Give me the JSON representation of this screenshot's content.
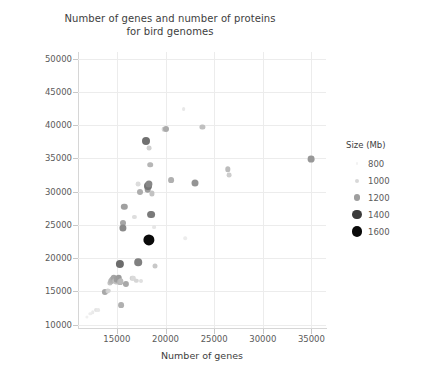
{
  "chart_data": {
    "type": "scatter",
    "title": "Number of genes and number of proteins for bird genomes",
    "title_line1": "Number of genes and number of proteins",
    "title_line2": "for bird genomes",
    "xlabel": "Number of genes",
    "ylabel": "Number of proteins",
    "xlim": [
      11000,
      36500
    ],
    "ylim": [
      9500,
      51000
    ],
    "xticks": [
      15000,
      20000,
      25000,
      30000,
      35000
    ],
    "yticks": [
      10000,
      15000,
      20000,
      25000,
      30000,
      35000,
      40000,
      45000,
      50000
    ],
    "xtick_labels": [
      "15000",
      "20000",
      "25000",
      "30000",
      "35000"
    ],
    "ytick_labels": [
      "10000",
      "15000",
      "20000",
      "25000",
      "30000",
      "35000",
      "40000",
      "45000",
      "50000"
    ],
    "grid": true,
    "size_encoding": "Genome size (Mb) mapped to marker area and darkness",
    "legend": {
      "title": "Size (Mb)",
      "position": "right",
      "entries": [
        {
          "label": "800",
          "value": 800,
          "radius": 1.2,
          "color": "#f2f2f2"
        },
        {
          "label": "1000",
          "value": 1000,
          "radius": 2.0,
          "color": "#d8d8d8"
        },
        {
          "label": "1200",
          "value": 1200,
          "radius": 3.2,
          "color": "#9e9e9e"
        },
        {
          "label": "1400",
          "value": 1400,
          "radius": 4.6,
          "color": "#3a3a3a"
        },
        {
          "label": "1600",
          "value": 1600,
          "radius": 5.4,
          "color": "#0a0a0a"
        }
      ]
    },
    "points": [
      {
        "x": 11900,
        "y": 11200,
        "size": 780,
        "r": 1.6,
        "color": "#f0f0f0"
      },
      {
        "x": 12250,
        "y": 11600,
        "size": 800,
        "r": 1.7,
        "color": "#ededed"
      },
      {
        "x": 12500,
        "y": 11900,
        "size": 820,
        "r": 1.8,
        "color": "#eaeaea"
      },
      {
        "x": 12800,
        "y": 12150,
        "size": 860,
        "r": 2.0,
        "color": "#e4e4e4"
      },
      {
        "x": 13050,
        "y": 12200,
        "size": 850,
        "r": 1.9,
        "color": "#e8e8e8"
      },
      {
        "x": 13800,
        "y": 14900,
        "size": 1180,
        "r": 3.1,
        "color": "#a8a8a8"
      },
      {
        "x": 14050,
        "y": 15000,
        "size": 1050,
        "r": 2.4,
        "color": "#cecece"
      },
      {
        "x": 14150,
        "y": 15100,
        "size": 1020,
        "r": 2.2,
        "color": "#d4d4d4"
      },
      {
        "x": 14300,
        "y": 16300,
        "size": 1080,
        "r": 2.6,
        "color": "#c4c4c4"
      },
      {
        "x": 14400,
        "y": 16500,
        "size": 1120,
        "r": 2.8,
        "color": "#b8b8b8"
      },
      {
        "x": 14500,
        "y": 16750,
        "size": 1150,
        "r": 2.9,
        "color": "#b2b2b2"
      },
      {
        "x": 14600,
        "y": 16900,
        "size": 1160,
        "r": 3.0,
        "color": "#aeaeae"
      },
      {
        "x": 14700,
        "y": 17050,
        "size": 1190,
        "r": 3.2,
        "color": "#a4a4a4"
      },
      {
        "x": 14850,
        "y": 16600,
        "size": 1100,
        "r": 2.7,
        "color": "#bcbcbc"
      },
      {
        "x": 14950,
        "y": 16500,
        "size": 1090,
        "r": 2.6,
        "color": "#c0c0c0"
      },
      {
        "x": 15050,
        "y": 16800,
        "size": 1200,
        "r": 3.3,
        "color": "#9e9e9e"
      },
      {
        "x": 15200,
        "y": 17000,
        "size": 1210,
        "r": 3.3,
        "color": "#9a9a9a"
      },
      {
        "x": 15300,
        "y": 16450,
        "size": 1140,
        "r": 2.9,
        "color": "#b4b4b4"
      },
      {
        "x": 15350,
        "y": 19150,
        "size": 1330,
        "r": 4.1,
        "color": "#6c6c6c"
      },
      {
        "x": 15400,
        "y": 16550,
        "size": 1100,
        "r": 2.7,
        "color": "#bababa"
      },
      {
        "x": 15450,
        "y": 12950,
        "size": 1150,
        "r": 2.9,
        "color": "#b0b0b0"
      },
      {
        "x": 15600,
        "y": 25300,
        "size": 1170,
        "r": 3.0,
        "color": "#a6a6a6"
      },
      {
        "x": 15650,
        "y": 24500,
        "size": 1260,
        "r": 3.6,
        "color": "#8a8a8a"
      },
      {
        "x": 15750,
        "y": 27700,
        "size": 1190,
        "r": 3.2,
        "color": "#a0a0a0"
      },
      {
        "x": 15900,
        "y": 16100,
        "size": 1180,
        "r": 3.1,
        "color": "#a8a8a8"
      },
      {
        "x": 16600,
        "y": 16950,
        "size": 1020,
        "r": 2.3,
        "color": "#d2d2d2"
      },
      {
        "x": 16700,
        "y": 17000,
        "size": 1000,
        "r": 2.2,
        "color": "#dadada"
      },
      {
        "x": 16800,
        "y": 26200,
        "size": 960,
        "r": 2.1,
        "color": "#dedede"
      },
      {
        "x": 17000,
        "y": 16600,
        "size": 1010,
        "r": 2.2,
        "color": "#d6d6d6"
      },
      {
        "x": 17150,
        "y": 31100,
        "size": 980,
        "r": 2.4,
        "color": "#dcdcdc"
      },
      {
        "x": 17200,
        "y": 19400,
        "size": 1290,
        "r": 3.8,
        "color": "#808080"
      },
      {
        "x": 17350,
        "y": 30000,
        "size": 1160,
        "r": 3.0,
        "color": "#adadad"
      },
      {
        "x": 17500,
        "y": 16550,
        "size": 960,
        "r": 2.0,
        "color": "#e0e0e0"
      },
      {
        "x": 17950,
        "y": 37600,
        "size": 1320,
        "r": 4.0,
        "color": "#707070"
      },
      {
        "x": 18150,
        "y": 30400,
        "size": 1200,
        "r": 3.3,
        "color": "#9c9c9c"
      },
      {
        "x": 18200,
        "y": 30900,
        "size": 1310,
        "r": 4.0,
        "color": "#747474"
      },
      {
        "x": 18250,
        "y": 31200,
        "size": 1270,
        "r": 3.6,
        "color": "#878787"
      },
      {
        "x": 18300,
        "y": 22750,
        "size": 1600,
        "r": 5.6,
        "color": "#0a0a0a"
      },
      {
        "x": 18350,
        "y": 36600,
        "size": 1040,
        "r": 2.4,
        "color": "#d0d0d0"
      },
      {
        "x": 18400,
        "y": 34050,
        "size": 1130,
        "r": 2.8,
        "color": "#b6b6b6"
      },
      {
        "x": 18500,
        "y": 26550,
        "size": 1300,
        "r": 3.9,
        "color": "#7a7a7a"
      },
      {
        "x": 18600,
        "y": 29750,
        "size": 1090,
        "r": 2.6,
        "color": "#c2c2c2"
      },
      {
        "x": 18800,
        "y": 24700,
        "size": 940,
        "r": 1.9,
        "color": "#e6e6e6"
      },
      {
        "x": 18950,
        "y": 18800,
        "size": 1070,
        "r": 2.5,
        "color": "#c8c8c8"
      },
      {
        "x": 19800,
        "y": 39350,
        "size": 1020,
        "r": 2.3,
        "color": "#d2d2d2"
      },
      {
        "x": 20050,
        "y": 39400,
        "size": 1160,
        "r": 3.0,
        "color": "#aaaaaa"
      },
      {
        "x": 20600,
        "y": 31700,
        "size": 1150,
        "r": 2.9,
        "color": "#b0b0b0"
      },
      {
        "x": 21850,
        "y": 42450,
        "size": 930,
        "r": 1.9,
        "color": "#e8e8e8"
      },
      {
        "x": 22000,
        "y": 23000,
        "size": 920,
        "r": 1.8,
        "color": "#ececec"
      },
      {
        "x": 23050,
        "y": 31250,
        "size": 1230,
        "r": 3.5,
        "color": "#949494"
      },
      {
        "x": 23800,
        "y": 39750,
        "size": 1090,
        "r": 2.6,
        "color": "#c0c0c0"
      },
      {
        "x": 26400,
        "y": 33350,
        "size": 1100,
        "r": 2.7,
        "color": "#bcbcbc"
      },
      {
        "x": 26500,
        "y": 32450,
        "size": 1040,
        "r": 2.4,
        "color": "#cdcdcd"
      },
      {
        "x": 35000,
        "y": 34900,
        "size": 1220,
        "r": 3.4,
        "color": "#989898"
      }
    ]
  }
}
